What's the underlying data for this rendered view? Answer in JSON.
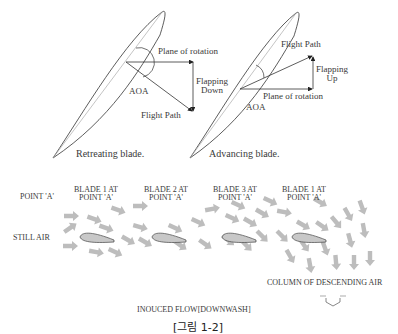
{
  "top_diagrams": {
    "retreating": {
      "caption": "Retreating blade.",
      "plane_label": "Plane of rotation",
      "flapping_label_1": "Flapping",
      "flapping_label_2": "Down",
      "aoa_label": "AOA",
      "flight_path_label": "Flight Path"
    },
    "advancing": {
      "caption": "Advancing blade.",
      "plane_label": "Plane of rotation",
      "flapping_label_1": "Flapping",
      "flapping_label_2": "Up",
      "aoa_label": "AOA",
      "flight_path_label": "Flight Path"
    }
  },
  "flow_diagram": {
    "columns": [
      {
        "line1": "POINT 'A'",
        "line2": ""
      },
      {
        "line1": "BLADE 1 AT",
        "line2": "POINT 'A'"
      },
      {
        "line1": "BLADE 2 AT",
        "line2": "POINT 'A'"
      },
      {
        "line1": "BLADE 3 AT",
        "line2": "POINT 'A'"
      },
      {
        "line1": "BLADE 1 AT",
        "line2": "POINT 'A'"
      }
    ],
    "still_air_label": "STILL AIR",
    "descending_label": "COLUMN OF DESCENDING AIR",
    "induced_flow_label": "INOUCED FLOW[DOWNWASH]"
  },
  "figure_caption": "[그림 1-2]",
  "colors": {
    "line": "#333333",
    "arrow": "#bdbdbd",
    "airfoil_fill": "#c8c8c8"
  }
}
